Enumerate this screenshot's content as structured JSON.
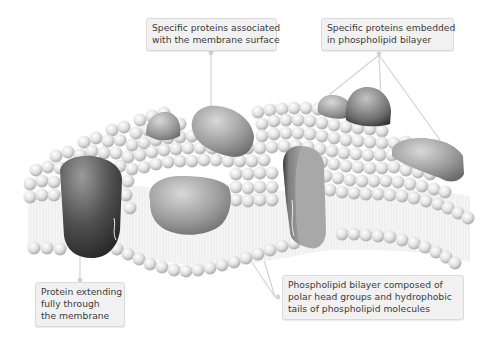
{
  "diagram": {
    "colors": {
      "background": "#ffffff",
      "label_bg": "#f1f1f1",
      "label_border": "#dadada",
      "label_text": "#3c3c3c",
      "connector": "#cfcfcf",
      "lipid_head": "#e4e4e4",
      "lipid_tail": "#eeeeee",
      "protein_dark": "#3a3a3a",
      "protein_mid": "#8c8c8c",
      "protein_light": "#c8c8c8"
    },
    "labels": [
      {
        "id": "surface",
        "lines": [
          "Specific proteins associated",
          "with the membrane surface"
        ],
        "points_to": "peripheral protein on top surface"
      },
      {
        "id": "embedded",
        "lines": [
          "Specific proteins embedded",
          "in phospholipid bilayer"
        ],
        "points_to": "three embedded proteins"
      },
      {
        "id": "through",
        "lines": [
          "Protein extending",
          "fully through",
          "the membrane"
        ],
        "points_to": "transmembrane protein on left"
      },
      {
        "id": "bilayer",
        "lines": [
          "Phospholipid bilayer composed of",
          "polar head groups and hydrophobic",
          "tails of phospholipid molecules"
        ],
        "points_to": "phospholipid bilayer"
      }
    ],
    "nodes": [
      {
        "id": "membrane",
        "type": "phospholipid-bilayer"
      },
      {
        "id": "protein-transmembrane-left",
        "type": "protein"
      },
      {
        "id": "protein-surface-top",
        "type": "protein"
      },
      {
        "id": "protein-small-top",
        "type": "protein"
      },
      {
        "id": "protein-center-embedded",
        "type": "protein"
      },
      {
        "id": "protein-channel",
        "type": "protein"
      },
      {
        "id": "protein-top-right-1",
        "type": "protein"
      },
      {
        "id": "protein-top-right-2",
        "type": "protein"
      },
      {
        "id": "protein-right-edge",
        "type": "protein"
      }
    ],
    "edges": [
      {
        "from": "surface",
        "to": "protein-surface-top"
      },
      {
        "from": "embedded",
        "to": "protein-top-right-1"
      },
      {
        "from": "embedded",
        "to": "protein-top-right-2"
      },
      {
        "from": "embedded",
        "to": "protein-right-edge"
      },
      {
        "from": "through",
        "to": "protein-transmembrane-left"
      },
      {
        "from": "bilayer",
        "to": "membrane"
      }
    ]
  }
}
